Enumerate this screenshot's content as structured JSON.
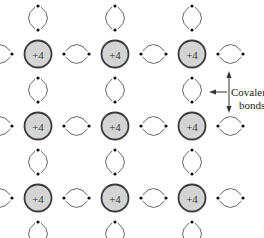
{
  "diagram": {
    "atom_label": "+4",
    "atom_fill": "#d4d4d4",
    "atom_stroke": "#3a3a3a",
    "columns_x": [
      38,
      115,
      192
    ],
    "rows_y": [
      54,
      126,
      198
    ],
    "atoms": [
      {
        "row": 0,
        "col": 0,
        "label": "+4"
      },
      {
        "row": 0,
        "col": 1,
        "label": "+4"
      },
      {
        "row": 0,
        "col": 2,
        "label": "+4"
      },
      {
        "row": 1,
        "col": 0,
        "label": "+4"
      },
      {
        "row": 1,
        "col": 1,
        "label": "+4"
      },
      {
        "row": 1,
        "col": 2,
        "label": "+4"
      },
      {
        "row": 2,
        "col": 0,
        "label": "+4"
      },
      {
        "row": 2,
        "col": 1,
        "label": "+4"
      },
      {
        "row": 2,
        "col": 2,
        "label": "+4"
      }
    ],
    "annotation": {
      "line1": "Covalent",
      "line2": "bonds"
    },
    "electrons_per_bond": 2
  }
}
